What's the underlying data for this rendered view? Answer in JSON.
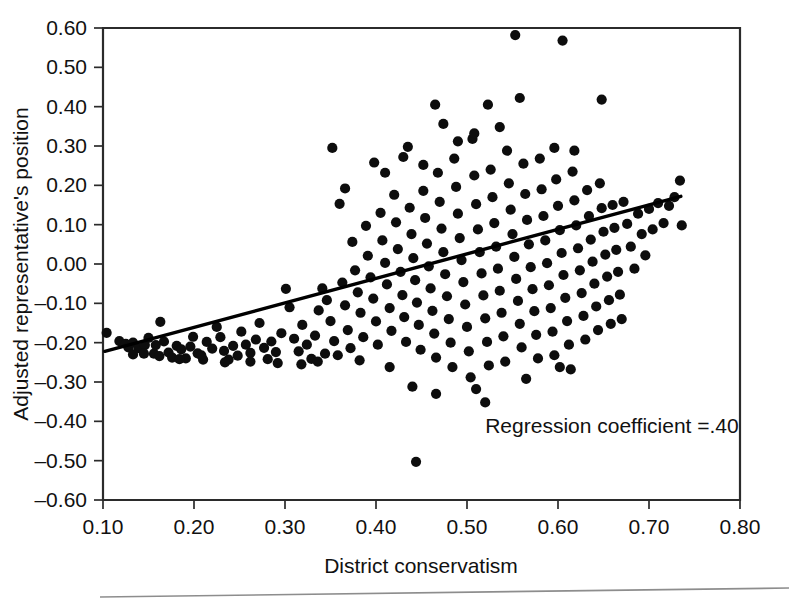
{
  "chart_data": {
    "type": "scatter",
    "title": "",
    "xlabel": "District conservatism",
    "ylabel": "Adjusted representative's position",
    "xlim": [
      0.1,
      0.8
    ],
    "ylim": [
      -0.6,
      0.6
    ],
    "grid": false,
    "legend": null,
    "xticks": [
      "0.10",
      "0.20",
      "0.30",
      "0.40",
      "0.50",
      "0.60",
      "0.70",
      "0.80"
    ],
    "xtick_values": [
      0.1,
      0.2,
      0.3,
      0.4,
      0.5,
      0.6,
      0.7,
      0.8
    ],
    "yticks": [
      "0.60",
      "0.50",
      "0.40",
      "0.30",
      "0.20",
      "0.10",
      "0.00",
      "–0.10",
      "–0.20",
      "–0.30",
      "–0.40",
      "–0.50",
      "–0.60"
    ],
    "ytick_values": [
      0.6,
      0.5,
      0.4,
      0.3,
      0.2,
      0.1,
      0.0,
      -0.1,
      -0.2,
      -0.3,
      -0.4,
      -0.5,
      -0.6
    ],
    "annotations": [
      {
        "text": "Regression coefficient =.40",
        "x": 0.52,
        "y": -0.43
      }
    ],
    "trendline": {
      "name": "regression line",
      "x": [
        0.102,
        0.735
      ],
      "y": [
        -0.222,
        0.172
      ],
      "slope": 0.4,
      "color": "#000000"
    },
    "series": [
      {
        "name": "representatives",
        "marker": "circle",
        "color": "#0d0d0d",
        "points": [
          [
            0.104,
            -0.175
          ],
          [
            0.118,
            -0.196
          ],
          [
            0.125,
            -0.203
          ],
          [
            0.128,
            -0.212
          ],
          [
            0.133,
            -0.2
          ],
          [
            0.139,
            -0.214
          ],
          [
            0.146,
            -0.206
          ],
          [
            0.15,
            -0.188
          ],
          [
            0.156,
            -0.228
          ],
          [
            0.158,
            -0.206
          ],
          [
            0.163,
            -0.147
          ],
          [
            0.167,
            -0.197
          ],
          [
            0.172,
            -0.225
          ],
          [
            0.176,
            -0.238
          ],
          [
            0.181,
            -0.208
          ],
          [
            0.186,
            -0.217
          ],
          [
            0.191,
            -0.24
          ],
          [
            0.196,
            -0.21
          ],
          [
            0.199,
            -0.185
          ],
          [
            0.204,
            -0.227
          ],
          [
            0.21,
            -0.243
          ],
          [
            0.214,
            -0.198
          ],
          [
            0.22,
            -0.215
          ],
          [
            0.225,
            -0.16
          ],
          [
            0.229,
            -0.186
          ],
          [
            0.233,
            -0.221
          ],
          [
            0.238,
            -0.243
          ],
          [
            0.243,
            -0.208
          ],
          [
            0.248,
            -0.233
          ],
          [
            0.252,
            -0.172
          ],
          [
            0.257,
            -0.205
          ],
          [
            0.262,
            -0.226
          ],
          [
            0.268,
            -0.192
          ],
          [
            0.272,
            -0.15
          ],
          [
            0.277,
            -0.213
          ],
          [
            0.281,
            -0.242
          ],
          [
            0.285,
            -0.197
          ],
          [
            0.29,
            -0.224
          ],
          [
            0.296,
            -0.176
          ],
          [
            0.301,
            -0.063
          ],
          [
            0.305,
            -0.11
          ],
          [
            0.31,
            -0.19
          ],
          [
            0.315,
            -0.222
          ],
          [
            0.319,
            -0.155
          ],
          [
            0.324,
            -0.205
          ],
          [
            0.329,
            -0.241
          ],
          [
            0.333,
            -0.182
          ],
          [
            0.337,
            -0.118
          ],
          [
            0.341,
            -0.062
          ],
          [
            0.346,
            -0.092
          ],
          [
            0.35,
            -0.145
          ],
          [
            0.354,
            -0.196
          ],
          [
            0.358,
            -0.232
          ],
          [
            0.36,
            0.153
          ],
          [
            0.363,
            -0.047
          ],
          [
            0.366,
            -0.105
          ],
          [
            0.369,
            -0.168
          ],
          [
            0.372,
            -0.214
          ],
          [
            0.374,
            0.056
          ],
          [
            0.377,
            -0.016
          ],
          [
            0.38,
            -0.072
          ],
          [
            0.383,
            -0.124
          ],
          [
            0.386,
            -0.186
          ],
          [
            0.389,
            0.097
          ],
          [
            0.391,
            0.021
          ],
          [
            0.394,
            -0.034
          ],
          [
            0.397,
            -0.088
          ],
          [
            0.4,
            -0.146
          ],
          [
            0.402,
            -0.205
          ],
          [
            0.405,
            0.13
          ],
          [
            0.407,
            0.06
          ],
          [
            0.41,
            0.003
          ],
          [
            0.412,
            -0.052
          ],
          [
            0.415,
            -0.112
          ],
          [
            0.417,
            -0.17
          ],
          [
            0.42,
            0.176
          ],
          [
            0.422,
            0.106
          ],
          [
            0.424,
            0.038
          ],
          [
            0.427,
            -0.02
          ],
          [
            0.429,
            -0.079
          ],
          [
            0.431,
            -0.135
          ],
          [
            0.433,
            -0.198
          ],
          [
            0.435,
            0.298
          ],
          [
            0.437,
            0.143
          ],
          [
            0.439,
            0.076
          ],
          [
            0.441,
            0.015
          ],
          [
            0.443,
            -0.041
          ],
          [
            0.445,
            -0.098
          ],
          [
            0.447,
            -0.155
          ],
          [
            0.449,
            -0.218
          ],
          [
            0.44,
            -0.312
          ],
          [
            0.444,
            -0.503
          ],
          [
            0.452,
            0.186
          ],
          [
            0.454,
            0.117
          ],
          [
            0.456,
            0.052
          ],
          [
            0.458,
            -0.006
          ],
          [
            0.46,
            -0.062
          ],
          [
            0.462,
            -0.119
          ],
          [
            0.464,
            -0.177
          ],
          [
            0.466,
            -0.238
          ],
          [
            0.468,
            0.232
          ],
          [
            0.47,
            0.158
          ],
          [
            0.472,
            0.09
          ],
          [
            0.474,
            0.03
          ],
          [
            0.476,
            -0.026
          ],
          [
            0.478,
            -0.082
          ],
          [
            0.48,
            -0.14
          ],
          [
            0.482,
            -0.2
          ],
          [
            0.484,
            -0.262
          ],
          [
            0.486,
            0.268
          ],
          [
            0.488,
            0.196
          ],
          [
            0.49,
            0.128
          ],
          [
            0.492,
            0.066
          ],
          [
            0.494,
            0.01
          ],
          [
            0.496,
            -0.046
          ],
          [
            0.498,
            -0.103
          ],
          [
            0.5,
            -0.16
          ],
          [
            0.502,
            -0.222
          ],
          [
            0.504,
            -0.288
          ],
          [
            0.465,
            0.405
          ],
          [
            0.506,
            0.318
          ],
          [
            0.508,
            0.225
          ],
          [
            0.51,
            0.152
          ],
          [
            0.512,
            0.088
          ],
          [
            0.514,
            0.03
          ],
          [
            0.516,
            -0.024
          ],
          [
            0.518,
            -0.08
          ],
          [
            0.52,
            -0.138
          ],
          [
            0.522,
            -0.198
          ],
          [
            0.524,
            -0.258
          ],
          [
            0.526,
            0.24
          ],
          [
            0.528,
            0.17
          ],
          [
            0.53,
            0.104
          ],
          [
            0.532,
            0.044
          ],
          [
            0.534,
            -0.012
          ],
          [
            0.536,
            -0.068
          ],
          [
            0.538,
            -0.124
          ],
          [
            0.54,
            -0.184
          ],
          [
            0.542,
            -0.248
          ],
          [
            0.544,
            0.288
          ],
          [
            0.546,
            0.205
          ],
          [
            0.548,
            0.138
          ],
          [
            0.55,
            0.076
          ],
          [
            0.552,
            0.018
          ],
          [
            0.554,
            -0.038
          ],
          [
            0.556,
            -0.094
          ],
          [
            0.558,
            -0.152
          ],
          [
            0.56,
            -0.212
          ],
          [
            0.553,
            0.582
          ],
          [
            0.605,
            0.568
          ],
          [
            0.523,
            0.405
          ],
          [
            0.558,
            0.422
          ],
          [
            0.562,
            0.255
          ],
          [
            0.564,
            0.178
          ],
          [
            0.566,
            0.112
          ],
          [
            0.568,
            0.05
          ],
          [
            0.57,
            -0.008
          ],
          [
            0.572,
            -0.064
          ],
          [
            0.574,
            -0.12
          ],
          [
            0.576,
            -0.18
          ],
          [
            0.578,
            -0.24
          ],
          [
            0.58,
            0.268
          ],
          [
            0.582,
            0.19
          ],
          [
            0.584,
            0.122
          ],
          [
            0.586,
            0.06
          ],
          [
            0.588,
            0.002
          ],
          [
            0.59,
            -0.054
          ],
          [
            0.592,
            -0.112
          ],
          [
            0.594,
            -0.172
          ],
          [
            0.596,
            -0.232
          ],
          [
            0.598,
            0.215
          ],
          [
            0.6,
            0.148
          ],
          [
            0.602,
            0.086
          ],
          [
            0.604,
            0.028
          ],
          [
            0.606,
            -0.028
          ],
          [
            0.608,
            -0.086
          ],
          [
            0.61,
            -0.145
          ],
          [
            0.612,
            -0.205
          ],
          [
            0.614,
            -0.268
          ],
          [
            0.616,
            0.235
          ],
          [
            0.618,
            0.162
          ],
          [
            0.62,
            0.098
          ],
          [
            0.622,
            0.04
          ],
          [
            0.624,
            -0.016
          ],
          [
            0.626,
            -0.074
          ],
          [
            0.628,
            -0.132
          ],
          [
            0.63,
            -0.192
          ],
          [
            0.632,
            0.188
          ],
          [
            0.634,
            0.122
          ],
          [
            0.636,
            0.062
          ],
          [
            0.638,
            0.006
          ],
          [
            0.64,
            -0.05
          ],
          [
            0.642,
            -0.108
          ],
          [
            0.644,
            -0.168
          ],
          [
            0.646,
            0.205
          ],
          [
            0.648,
            0.142
          ],
          [
            0.65,
            0.082
          ],
          [
            0.652,
            0.024
          ],
          [
            0.654,
            -0.032
          ],
          [
            0.656,
            -0.092
          ],
          [
            0.658,
            -0.152
          ],
          [
            0.66,
            0.15
          ],
          [
            0.662,
            0.092
          ],
          [
            0.664,
            0.036
          ],
          [
            0.666,
            -0.02
          ],
          [
            0.668,
            -0.078
          ],
          [
            0.67,
            -0.14
          ],
          [
            0.672,
            0.158
          ],
          [
            0.676,
            0.102
          ],
          [
            0.68,
            0.044
          ],
          [
            0.684,
            -0.012
          ],
          [
            0.688,
            0.128
          ],
          [
            0.692,
            0.076
          ],
          [
            0.696,
            0.022
          ],
          [
            0.7,
            0.14
          ],
          [
            0.704,
            0.088
          ],
          [
            0.71,
            0.155
          ],
          [
            0.716,
            0.104
          ],
          [
            0.722,
            0.148
          ],
          [
            0.728,
            0.17
          ],
          [
            0.734,
            0.212
          ],
          [
            0.736,
            0.098
          ],
          [
            0.648,
            0.418
          ],
          [
            0.596,
            0.295
          ],
          [
            0.618,
            0.288
          ],
          [
            0.508,
            0.332
          ],
          [
            0.49,
            0.312
          ],
          [
            0.452,
            0.252
          ],
          [
            0.43,
            0.272
          ],
          [
            0.474,
            0.356
          ],
          [
            0.536,
            0.348
          ],
          [
            0.366,
            0.192
          ],
          [
            0.352,
            0.295
          ],
          [
            0.41,
            0.232
          ],
          [
            0.398,
            0.258
          ],
          [
            0.466,
            -0.33
          ],
          [
            0.52,
            -0.352
          ],
          [
            0.602,
            -0.262
          ],
          [
            0.565,
            -0.292
          ],
          [
            0.415,
            -0.262
          ],
          [
            0.51,
            -0.318
          ],
          [
            0.382,
            -0.245
          ],
          [
            0.344,
            -0.228
          ],
          [
            0.336,
            -0.248
          ],
          [
            0.318,
            -0.255
          ],
          [
            0.292,
            -0.252
          ],
          [
            0.262,
            -0.248
          ],
          [
            0.234,
            -0.25
          ],
          [
            0.208,
            -0.232
          ],
          [
            0.184,
            -0.242
          ],
          [
            0.162,
            -0.234
          ],
          [
            0.145,
            -0.228
          ],
          [
            0.133,
            -0.23
          ]
        ]
      }
    ]
  },
  "axis": {
    "frame_color": "#2b2b2b",
    "marker_color": "#0d0d0d"
  }
}
